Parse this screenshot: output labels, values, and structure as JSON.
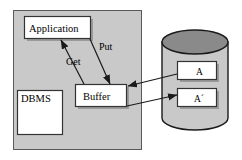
{
  "diagram": {
    "panel": {
      "name": "dbms-system-panel",
      "fill": "#c9c9c9",
      "stroke": "#555555"
    },
    "nodes": [
      {
        "id": "application",
        "label": "Application",
        "fill": "#ffffff",
        "stroke": "#333333"
      },
      {
        "id": "dbms",
        "label": "DBMS",
        "fill": "#ffffff",
        "stroke": "#333333"
      },
      {
        "id": "buffer",
        "label": "Buffer",
        "fill": "#ffffff",
        "stroke": "#333333"
      },
      {
        "id": "page_a",
        "label": "A",
        "fill": "#ffffff",
        "stroke": "#333333"
      },
      {
        "id": "page_a_prime",
        "label": "A´",
        "fill": "#ffffff",
        "stroke": "#333333"
      }
    ],
    "edges": [
      {
        "id": "get",
        "label": "Get",
        "from": "buffer",
        "to": "application"
      },
      {
        "id": "put",
        "label": "Put",
        "from": "application",
        "to": "buffer"
      },
      {
        "id": "read",
        "label": "",
        "from": "page_a",
        "to": "buffer"
      },
      {
        "id": "write",
        "label": "",
        "from": "buffer",
        "to": "page_a_prime"
      }
    ],
    "storage": {
      "name": "database-cylinder",
      "body_fill": "#c9c9c9",
      "top_fill": "#8a8a8a",
      "stroke": "#1a1a1a"
    },
    "colors": {
      "line": "#1a1a1a",
      "shadow": "#9a9a9a",
      "background": "#ffffff"
    }
  }
}
